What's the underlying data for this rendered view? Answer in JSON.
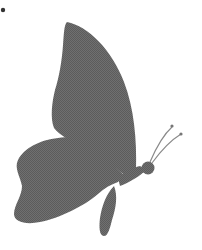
{
  "image": {
    "subject": "Butterfly silhouette",
    "description": "Gray halftone-textured butterfly seen from the side, facing right, with a large upper wing, a rounded lower wing, a tail-like extension, a round head and two thin antennae with dotted tips. A small dark dot appears in the top-left corner.",
    "colors": {
      "background": "#ffffff",
      "silhouette": "#6a6a6a",
      "antenna": "#8a8a8a",
      "corner_dot": "#333333"
    }
  }
}
